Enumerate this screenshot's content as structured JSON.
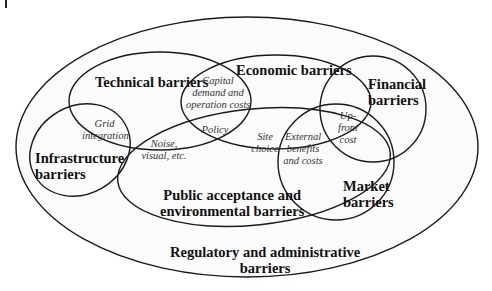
{
  "diagram": {
    "type": "venn",
    "sets": {
      "regulatory": {
        "label_line1": "Regulatory and administrative",
        "label_line2": "barriers"
      },
      "technical": {
        "label": "Technical barriers"
      },
      "economic": {
        "label": "Economic barriers"
      },
      "financial": {
        "label_line1": "Financial",
        "label_line2": "barriers"
      },
      "infrastructure": {
        "label_line1": "Infrastructure",
        "label_line2": "barriers"
      },
      "public": {
        "label_line1": "Public acceptance and",
        "label_line2": "environmental barriers"
      },
      "market": {
        "label_line1": "Market",
        "label_line2": "barriers"
      }
    },
    "intersections": {
      "grid": {
        "line1": "Grid",
        "line2": "integration"
      },
      "capital": {
        "line1": "Capital",
        "line2": "demand and",
        "line3": "operation costs"
      },
      "noise": {
        "line1": "Noise,",
        "line2": "visual, etc."
      },
      "policy": {
        "line1": "Policy"
      },
      "site": {
        "line1": "Site",
        "line2": "choice"
      },
      "external": {
        "line1": "External",
        "line2": "benefits",
        "line3": "and costs"
      },
      "upfront": {
        "line1": "Up-",
        "line2": "front",
        "line3": "cost"
      }
    }
  }
}
